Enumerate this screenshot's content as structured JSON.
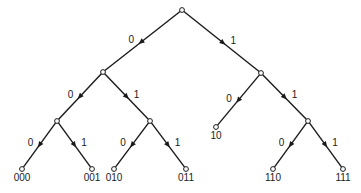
{
  "diagram": {
    "type": "binary-code-tree",
    "colors": {
      "line": "#1a1a1a",
      "background": "#ffffff"
    },
    "nodes": [
      {
        "id": "root",
        "x": 182,
        "y": 10,
        "label": ""
      },
      {
        "id": "0",
        "x": 103,
        "y": 72,
        "label": ""
      },
      {
        "id": "1",
        "x": 261,
        "y": 73,
        "label": ""
      },
      {
        "id": "00",
        "x": 57,
        "y": 121,
        "label": ""
      },
      {
        "id": "01",
        "x": 150,
        "y": 121,
        "label": ""
      },
      {
        "id": "10",
        "x": 216,
        "y": 127,
        "label": "10"
      },
      {
        "id": "11",
        "x": 308,
        "y": 121,
        "label": ""
      },
      {
        "id": "000",
        "x": 22,
        "y": 169,
        "label": "000"
      },
      {
        "id": "001",
        "x": 92,
        "y": 169,
        "label": "001"
      },
      {
        "id": "010",
        "x": 114,
        "y": 169,
        "label": "010"
      },
      {
        "id": "011",
        "x": 186,
        "y": 169,
        "label": "011"
      },
      {
        "id": "110",
        "x": 273,
        "y": 169,
        "label": "110"
      },
      {
        "id": "111",
        "x": 343,
        "y": 169,
        "label": "111"
      }
    ],
    "edges": [
      {
        "from": "root",
        "to": "0",
        "label": "0"
      },
      {
        "from": "root",
        "to": "1",
        "label": "1"
      },
      {
        "from": "0",
        "to": "00",
        "label": "0"
      },
      {
        "from": "0",
        "to": "01",
        "label": "1"
      },
      {
        "from": "1",
        "to": "10",
        "label": "0"
      },
      {
        "from": "1",
        "to": "11",
        "label": "1"
      },
      {
        "from": "00",
        "to": "000",
        "label": "0"
      },
      {
        "from": "00",
        "to": "001",
        "label": "1"
      },
      {
        "from": "01",
        "to": "010",
        "label": "0"
      },
      {
        "from": "01",
        "to": "011",
        "label": "1"
      },
      {
        "from": "11",
        "to": "110",
        "label": "0"
      },
      {
        "from": "11",
        "to": "111",
        "label": "1"
      }
    ]
  }
}
